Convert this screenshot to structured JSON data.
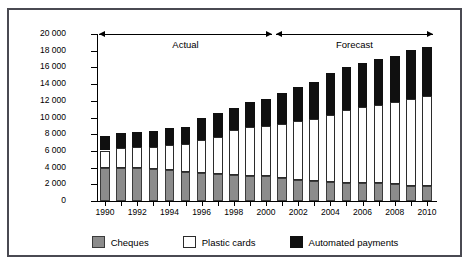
{
  "chart_data": {
    "type": "bar",
    "subtype": "stacked-vertical",
    "title": "",
    "xlabel": "",
    "ylabel": "Volumes millions",
    "ylim": [
      0,
      20000
    ],
    "yticks": [
      0,
      2000,
      4000,
      6000,
      8000,
      10000,
      12000,
      14000,
      16000,
      18000,
      20000
    ],
    "ytick_labels": [
      "0",
      "2 000",
      "4 000",
      "6 000",
      "8 000",
      "10 000",
      "12 000",
      "14 000",
      "16 000",
      "18 000",
      "20 000"
    ],
    "grid": false,
    "legend_position": "bottom",
    "categories": [
      "1990",
      "1991",
      "1992",
      "1993",
      "1994",
      "1995",
      "1996",
      "1997",
      "1998",
      "1999",
      "2000",
      "2001",
      "2002",
      "2003",
      "2004",
      "2005",
      "2006",
      "2007",
      "2008",
      "2009",
      "2010"
    ],
    "xtick_labels": [
      "1990",
      "",
      "1992",
      "",
      "1994",
      "",
      "1996",
      "",
      "1998",
      "",
      "2000",
      "",
      "2002",
      "",
      "2004",
      "",
      "2006",
      "",
      "2008",
      "",
      "2010"
    ],
    "series": [
      {
        "name": "Cheques",
        "color": "#8c8c8c",
        "values": [
          4000,
          3950,
          3900,
          3800,
          3750,
          3500,
          3400,
          3250,
          3150,
          3000,
          2950,
          2700,
          2550,
          2400,
          2300,
          2200,
          2150,
          2100,
          2000,
          1850,
          1800
        ]
      },
      {
        "name": "Plastic cards",
        "color": "#ffffff",
        "values": [
          2050,
          2350,
          2550,
          2700,
          3000,
          3300,
          3950,
          4400,
          5300,
          5900,
          6000,
          6500,
          7000,
          7400,
          8000,
          8700,
          9100,
          9450,
          9800,
          10350,
          10800
        ]
      },
      {
        "name": "Automated payments",
        "color": "#101010",
        "values": [
          1750,
          1800,
          1800,
          1900,
          2000,
          2100,
          2550,
          2850,
          2650,
          2900,
          3300,
          3700,
          4050,
          4400,
          5050,
          5100,
          5250,
          5400,
          5600,
          5900,
          5900
        ]
      }
    ],
    "totals": [
      7800,
      8100,
      8250,
      8400,
      8750,
      8900,
      9900,
      10500,
      11100,
      11800,
      12250,
      12900,
      13600,
      14200,
      15350,
      16000,
      16500,
      16950,
      17400,
      18100,
      18500
    ],
    "annotations": [
      {
        "label": "Actual",
        "from": "1990",
        "to": "2000",
        "style": "double-arrow"
      },
      {
        "label": "Forecast",
        "from": "2001",
        "to": "2010",
        "style": "double-arrow"
      }
    ]
  },
  "legend": {
    "items": [
      {
        "label": "Cheques",
        "swatch": "cheques-swatch"
      },
      {
        "label": "Plastic cards",
        "swatch": "plastic-cards-swatch"
      },
      {
        "label": "Automated payments",
        "swatch": "automated-payments-swatch"
      }
    ]
  },
  "colors": {
    "cheques": "#8c8c8c",
    "plastic_cards": "#ffffff",
    "automated_payments": "#101010",
    "frame": "#4a4a52",
    "axis": "#000000",
    "background": "#ffffff"
  }
}
